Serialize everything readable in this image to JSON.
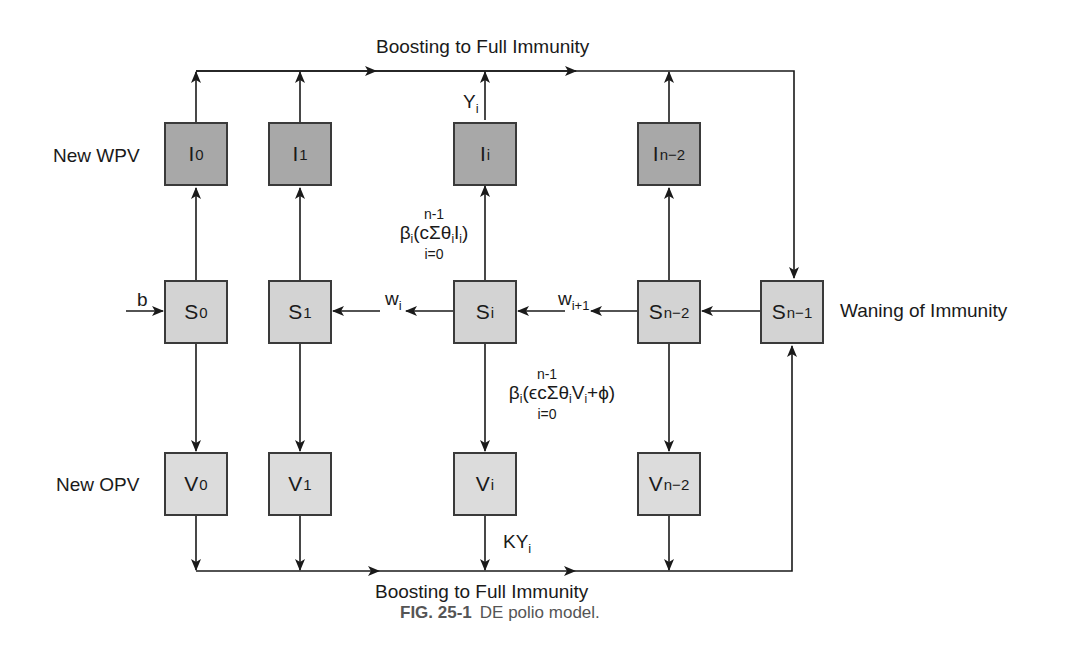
{
  "figure": {
    "caption_number": "FIG. 25-1",
    "caption_text": "DE polio model."
  },
  "labels": {
    "top_flow": "Boosting to Full Immunity",
    "bottom_flow": "Boosting to Full Immunity",
    "new_wpv": "New WPV",
    "new_opv": "New OPV",
    "waning": "Waning of Immunity",
    "birth": "b",
    "yi_base": "Y",
    "yi_sub": "i",
    "kyi_base": "KY",
    "kyi_sub": "i",
    "wi_base": "w",
    "wi_sub": "i",
    "wi1_base": "w",
    "wi1_sub": "i+1"
  },
  "formulas": {
    "infection": {
      "upper": "n-1",
      "beta": "β",
      "beta_sub": "i",
      "body_pre": "(cΣθ",
      "theta_sub": "i",
      "var": "I",
      "var_sub": "i",
      "body_post": ")",
      "lower": "i=0"
    },
    "vaccination": {
      "upper": "n-1",
      "beta": "β",
      "beta_sub": "i",
      "body_pre": "(ϵcΣθ",
      "theta_sub": "i",
      "var": "V",
      "var_sub": "i",
      "body_post": "+ϕ)",
      "lower": "i=0"
    }
  },
  "compartments": {
    "infected": [
      {
        "base": "I",
        "sub": "0"
      },
      {
        "base": "I",
        "sub": "1"
      },
      {
        "base": "I",
        "sub": "i"
      },
      {
        "base": "I",
        "sub": "n−2"
      }
    ],
    "susceptible": [
      {
        "base": "S",
        "sub": "0"
      },
      {
        "base": "S",
        "sub": "1"
      },
      {
        "base": "S",
        "sub": "i"
      },
      {
        "base": "S",
        "sub": "n−2"
      },
      {
        "base": "S",
        "sub": "n−1"
      }
    ],
    "vaccinated": [
      {
        "base": "V",
        "sub": "0"
      },
      {
        "base": "V",
        "sub": "1"
      },
      {
        "base": "V",
        "sub": "i"
      },
      {
        "base": "V",
        "sub": "n−2"
      }
    ]
  },
  "colors": {
    "infected_fill": "#a8a8a8",
    "susceptible_fill": "#d3d3d3",
    "vaccinated_fill": "#dcdcdc",
    "stroke": "#1a1a1a",
    "caption": "#555555"
  }
}
